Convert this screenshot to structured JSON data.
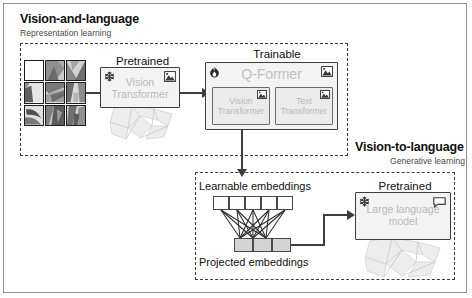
{
  "figure": {
    "sections": [
      {
        "id": "vision-and-language",
        "title": "Vision-and-language",
        "subtitle": "Representation learning"
      },
      {
        "id": "vision-to-language",
        "title": "Vision-to-language",
        "subtitle": "Generative learning"
      }
    ],
    "stage_captions": {
      "pretrained_vit": "Pretrained",
      "trainable_qformer": "Trainable",
      "pretrained_llm": "Pretrained"
    },
    "blocks": {
      "vision_transformer": "Vision\nTransformer",
      "q_former": "Q-Former",
      "q_former_vision_transformer": "Vision\nTransformer",
      "q_former_text_transformer": "Text\nTransformer",
      "large_language_model": "Large language\nmodel"
    },
    "embeddings": {
      "learnable_label": "Learnable embeddings",
      "projected_label": "Projected embeddings",
      "learnable_count": 5,
      "projected_count": 3
    },
    "icons": {
      "frozen": "snowflake-icon",
      "trainable": "flame-icon",
      "image_modality": "image-icon",
      "text_modality": "speech-bubble-icon"
    },
    "colors": {
      "ink": "#2d2d2d",
      "box_fill": "#f3f3f3",
      "inner_box_fill": "#ebebeb",
      "ghost_text": "#bdbdbd",
      "token_white": "#fdfdfd",
      "token_gray": "#d4d4d4",
      "dashed_border": "#3a3a3a",
      "frame": "#8f8f8f"
    }
  }
}
